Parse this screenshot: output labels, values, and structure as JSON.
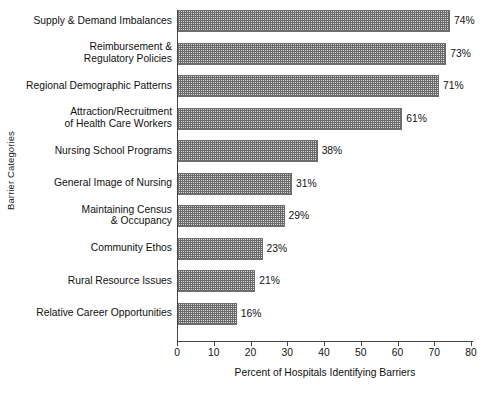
{
  "chart_data": {
    "type": "bar",
    "orientation": "horizontal",
    "title": "",
    "xlabel": "Percent of Hospitals Identifying Barriers",
    "ylabel": "Barrier Categories",
    "xlim": [
      0,
      80
    ],
    "xticks": [
      0,
      10,
      20,
      30,
      40,
      50,
      60,
      70,
      80
    ],
    "xtick_labels": [
      "0",
      "10",
      "20",
      "30",
      "40",
      "50",
      "60",
      "70",
      "80"
    ],
    "grid": false,
    "legend": false,
    "value_label_suffix": "%",
    "categories": [
      "Supply & Demand Imbalances",
      "Reimbursement &\nRegulatory Policies",
      "Regional Demographic Patterns",
      "Attraction/Recruitment\nof Health Care Workers",
      "Nursing School Programs",
      "General Image of Nursing",
      "Maintaining Census\n& Occupancy",
      "Community Ethos",
      "Rural Resource Issues",
      "Relative Career Opportunities"
    ],
    "values": [
      74,
      73,
      71,
      61,
      38,
      31,
      29,
      23,
      21,
      16
    ],
    "value_labels": [
      "74%",
      "73%",
      "71%",
      "61%",
      "38%",
      "31%",
      "29%",
      "23%",
      "21%",
      "16%"
    ],
    "bar_fill_color": "#d8d8d8",
    "bar_edge_color": "#6e6e6e",
    "axis_color": "#444444",
    "background_color": "#ffffff"
  }
}
